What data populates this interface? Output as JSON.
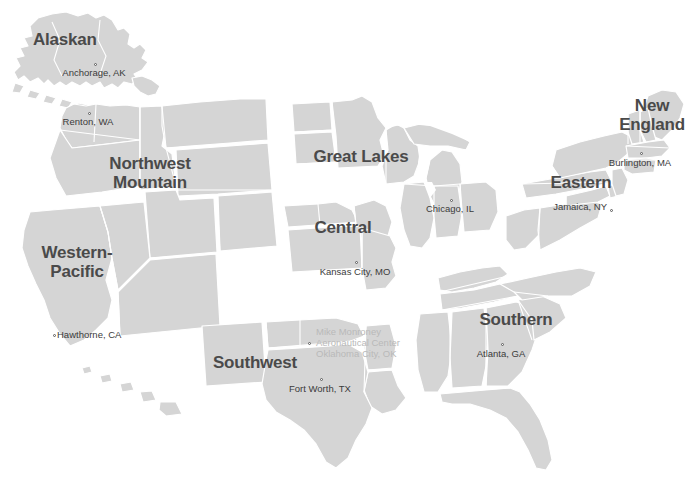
{
  "map": {
    "title": "FAA Regions Map",
    "colors": {
      "land": "#d5d5d5",
      "border": "#ffffff",
      "background": "#ffffff",
      "region_label": "#4a4a4a",
      "city_label": "#3b3b3b",
      "faded_label": "#b9b9b9"
    },
    "footer_caption": "",
    "regions": [
      {
        "id": "alaskan",
        "label": "Alaskan",
        "x": 33,
        "y": 30,
        "width": 104,
        "align": "left"
      },
      {
        "id": "northwest-mountain",
        "label": "Northwest\nMountain",
        "x": 85,
        "y": 154,
        "width": 130,
        "align": "center"
      },
      {
        "id": "western-pacific",
        "label": "Western-\nPacific",
        "x": 25,
        "y": 243,
        "width": 104,
        "align": "center"
      },
      {
        "id": "great-lakes",
        "label": "Great Lakes",
        "x": 296,
        "y": 147,
        "width": 130,
        "align": "center"
      },
      {
        "id": "central",
        "label": "Central",
        "x": 300,
        "y": 218,
        "width": 86,
        "align": "center"
      },
      {
        "id": "southwest",
        "label": "Southwest",
        "x": 196,
        "y": 353,
        "width": 118,
        "align": "center"
      },
      {
        "id": "southern",
        "label": "Southern",
        "x": 466,
        "y": 310,
        "width": 100,
        "align": "center"
      },
      {
        "id": "eastern",
        "label": "Eastern",
        "x": 538,
        "y": 173,
        "width": 86,
        "align": "center"
      },
      {
        "id": "new-england",
        "label": "New\nEngland",
        "x": 606,
        "y": 96,
        "width": 92,
        "align": "center"
      }
    ],
    "cities": [
      {
        "id": "anchorage",
        "name": "Anchorage, AK",
        "dot_x": 94,
        "dot_y": 63,
        "label_x": 44,
        "label_y": 67,
        "label_w": 100,
        "align": "center",
        "faded": false
      },
      {
        "id": "renton",
        "name": "Renton, WA",
        "dot_x": 88,
        "dot_y": 112,
        "label_x": 40,
        "label_y": 116,
        "label_w": 96,
        "align": "center",
        "faded": false
      },
      {
        "id": "hawthorne",
        "name": "Hawthorne, CA",
        "dot_x": 53,
        "dot_y": 334,
        "label_x": 57,
        "label_y": 329,
        "label_w": 92,
        "align": "left",
        "faded": false
      },
      {
        "id": "chicago",
        "name": "Chicago, IL",
        "dot_x": 450,
        "dot_y": 199,
        "label_x": 404,
        "label_y": 203,
        "label_w": 92,
        "align": "center",
        "faded": false
      },
      {
        "id": "kansas-city",
        "name": "Kansas City, MO",
        "dot_x": 355,
        "dot_y": 261,
        "label_x": 305,
        "label_y": 266,
        "label_w": 100,
        "align": "center",
        "faded": false
      },
      {
        "id": "mike-monroney",
        "name": "Mike Monroney\nAeronautical Center\nOklahoma City, OK",
        "dot_x": 308,
        "dot_y": 342,
        "label_x": 316,
        "label_y": 326,
        "label_w": 104,
        "align": "left",
        "faded": true
      },
      {
        "id": "fort-worth",
        "name": "Fort Worth, TX",
        "dot_x": 320,
        "dot_y": 378,
        "label_x": 272,
        "label_y": 383,
        "label_w": 96,
        "align": "center",
        "faded": false
      },
      {
        "id": "atlanta",
        "name": "Atlanta, GA",
        "dot_x": 501,
        "dot_y": 343,
        "label_x": 457,
        "label_y": 348,
        "label_w": 88,
        "align": "center",
        "faded": false
      },
      {
        "id": "jamaica",
        "name": "Jamaica, NY",
        "dot_x": 610,
        "dot_y": 209,
        "label_x": 545,
        "label_y": 201,
        "label_w": 62,
        "align": "right",
        "faded": false
      },
      {
        "id": "burlington",
        "name": "Burlington, MA",
        "dot_x": 640,
        "dot_y": 152,
        "label_x": 593,
        "label_y": 157,
        "label_w": 94,
        "align": "center",
        "faded": false
      }
    ]
  }
}
